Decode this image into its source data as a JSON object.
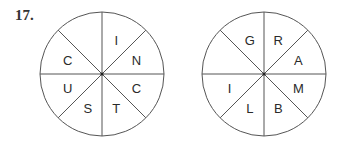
{
  "problem": {
    "number": "17."
  },
  "wheels": [
    {
      "name": "left-wheel",
      "cx": 102,
      "cy": 74,
      "r": 62,
      "segments": [
        {
          "position": "top-left",
          "letter": ""
        },
        {
          "position": "top-right",
          "letter": "I"
        },
        {
          "position": "right-top",
          "letter": "N"
        },
        {
          "position": "right-bottom",
          "letter": "C"
        },
        {
          "position": "bottom-right",
          "letter": "T"
        },
        {
          "position": "bottom-left",
          "letter": "S"
        },
        {
          "position": "left-bottom",
          "letter": "U"
        },
        {
          "position": "left-top",
          "letter": "C"
        }
      ]
    },
    {
      "name": "right-wheel",
      "cx": 264,
      "cy": 74,
      "r": 62,
      "segments": [
        {
          "position": "top-left",
          "letter": "G"
        },
        {
          "position": "top-right",
          "letter": "R"
        },
        {
          "position": "right-top",
          "letter": "A"
        },
        {
          "position": "right-bottom",
          "letter": "M"
        },
        {
          "position": "bottom-right",
          "letter": "B"
        },
        {
          "position": "bottom-left",
          "letter": "L"
        },
        {
          "position": "left-bottom",
          "letter": "I"
        },
        {
          "position": "left-top",
          "letter": ""
        }
      ]
    }
  ],
  "colors": {
    "stroke": "#555555",
    "text": "#2a2a2a"
  }
}
